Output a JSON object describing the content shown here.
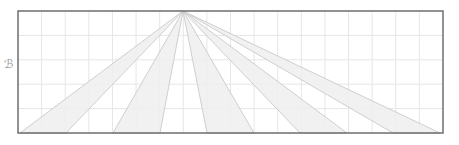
{
  "diagram": {
    "side_label": "ℬ",
    "frame": {
      "x": 18,
      "y": 11,
      "width": 425,
      "height": 122
    },
    "grid": {
      "columns": 18,
      "rows": 5,
      "color": "#e4e4e4"
    },
    "vanishing_point": {
      "x": 183,
      "y": 11
    },
    "wedges": [
      {
        "x1": 20,
        "x2": 66
      },
      {
        "x1": 113,
        "x2": 160
      },
      {
        "x1": 207,
        "x2": 254
      },
      {
        "x1": 300,
        "x2": 347
      },
      {
        "x1": 393,
        "x2": 440
      }
    ],
    "colors": {
      "frame": "#6e6e6e",
      "ray": "#cfcfcf",
      "wedge_fill": "#efefef",
      "grid": "#e6e6e6"
    }
  }
}
